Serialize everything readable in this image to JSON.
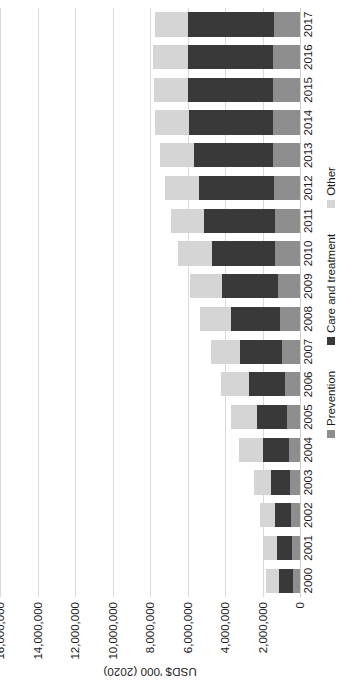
{
  "chart_data": {
    "type": "bar",
    "subtype": "stacked-bar",
    "orientation": "vertical-bars-rotated-90ccw",
    "title": "",
    "xlabel": "",
    "ylabel": "USD$ '000 (2020)",
    "ylim": [
      0,
      16000000
    ],
    "yticks": [
      0,
      2000000,
      4000000,
      6000000,
      8000000,
      10000000,
      12000000,
      14000000,
      16000000
    ],
    "ytick_labels": [
      "0",
      "2,000,000",
      "4,000,000",
      "6,000,000",
      "8,000,000",
      "10,000,000",
      "12,000,000",
      "14,000,000",
      "16,000,000"
    ],
    "grid": true,
    "legend_position": "bottom",
    "categories": [
      "2000",
      "2001",
      "2002",
      "2003",
      "2004",
      "2005",
      "2006",
      "2007",
      "2008",
      "2009",
      "2010",
      "2011",
      "2012",
      "2013",
      "2014",
      "2015",
      "2016",
      "2017"
    ],
    "series": [
      {
        "name": "Prevention",
        "color": "#8e8e8e",
        "values": [
          400000,
          430000,
          460000,
          540000,
          600000,
          690000,
          800000,
          950000,
          1080000,
          1200000,
          1310000,
          1360000,
          1400000,
          1430000,
          1450000,
          1430000,
          1420000,
          1400000
        ]
      },
      {
        "name": "Care and treatment",
        "color": "#393939",
        "values": [
          740000,
          800000,
          880000,
          1030000,
          1400000,
          1600000,
          1900000,
          2250000,
          2620000,
          2980000,
          3400000,
          3740000,
          4000000,
          4250000,
          4460000,
          4540000,
          4560000,
          4550000
        ]
      },
      {
        "name": "Other",
        "color": "#d5d5d5",
        "values": [
          680000,
          730000,
          790000,
          880000,
          1230000,
          1400000,
          1500000,
          1560000,
          1640000,
          1700000,
          1780000,
          1790000,
          1800000,
          1810000,
          1820000,
          1830000,
          1850000,
          1800000
        ]
      }
    ],
    "totals": [
      1820000,
      1960000,
      2130000,
      2450000,
      3230000,
      3690000,
      4200000,
      4760000,
      5340000,
      5880000,
      6490000,
      6890000,
      7200000,
      7490000,
      7730000,
      7800000,
      7830000,
      7750000
    ]
  },
  "legend": {
    "items": [
      {
        "label": "Prevention",
        "color": "#8e8e8e"
      },
      {
        "label": "Care and treatment",
        "color": "#393939"
      },
      {
        "label": "Other",
        "color": "#d5d5d5"
      }
    ]
  }
}
